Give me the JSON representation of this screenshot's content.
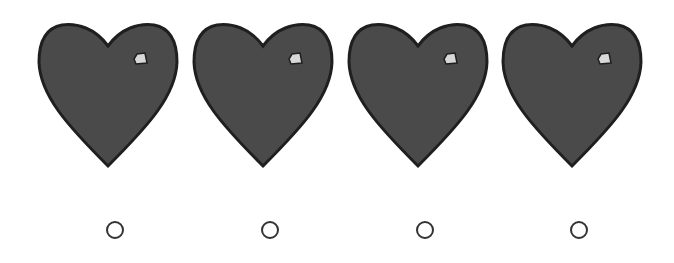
{
  "prompt": "",
  "colors": {
    "heart_fill": "#4a4a4a",
    "heart_stroke": "#1f1f1f",
    "tag_fill": "#d8d8d8",
    "radio_border": "#333333"
  },
  "options": [
    {
      "id": 1,
      "icon": "heart-icon",
      "selected": false
    },
    {
      "id": 2,
      "icon": "heart-icon",
      "selected": false
    },
    {
      "id": 3,
      "icon": "heart-icon",
      "selected": false
    },
    {
      "id": 4,
      "icon": "heart-icon",
      "selected": false
    }
  ]
}
